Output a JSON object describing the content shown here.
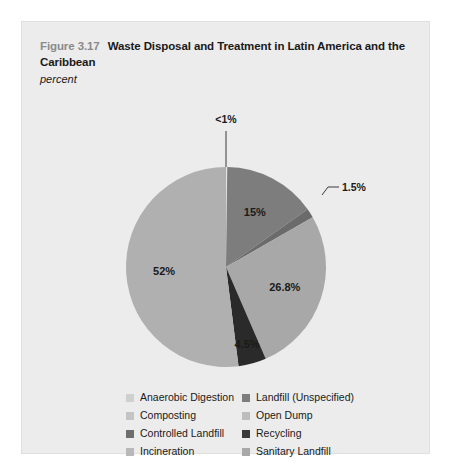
{
  "figure": {
    "number": "Figure 3.17",
    "title": "Waste Disposal and Treatment in Latin America and the Caribbean",
    "subtitle": "percent"
  },
  "chart_data": {
    "type": "pie",
    "title": "Waste Disposal and Treatment in Latin America and the Caribbean",
    "subtitle": "percent",
    "unit": "percent",
    "legend_position": "bottom",
    "start_angle_deg": 0,
    "direction": "clockwise",
    "categories": [
      "Anaerobic Digestion",
      "Landfill (Unspecified)",
      "Open Dump",
      "Sanitary Landfill",
      "Recycling",
      "Composting"
    ],
    "values": [
      0.2,
      15.0,
      1.5,
      26.8,
      4.5,
      52.0
    ],
    "labels": [
      "<1%",
      "15%",
      "1.5%",
      "26.8%",
      "4.5%",
      "52%"
    ],
    "colors": [
      "#e3e3e3",
      "#7d7d7d",
      "#6b6b6b",
      "#a8a8a8",
      "#2a2a2a",
      "#b0b0b0"
    ],
    "callouts": [
      "<1%",
      "1.5%"
    ],
    "inner_labels": [
      "15%",
      "26.8%",
      "4.5%",
      "52%"
    ]
  },
  "slices": [
    {
      "name": "anaerobic-digestion",
      "label": "<1%",
      "value": 0.2,
      "color": "#e3e3e3"
    },
    {
      "name": "landfill-unspecified",
      "label": "15%",
      "value": 15.0,
      "color": "#7d7d7d"
    },
    {
      "name": "open-dump",
      "label": "1.5%",
      "value": 1.5,
      "color": "#6b6b6b"
    },
    {
      "name": "sanitary-landfill",
      "label": "26.8%",
      "value": 26.8,
      "color": "#a8a8a8"
    },
    {
      "name": "recycling",
      "label": "4.5%",
      "value": 4.5,
      "color": "#2a2a2a"
    },
    {
      "name": "composting",
      "label": "52%",
      "value": 52.0,
      "color": "#b0b0b0"
    }
  ],
  "legend": {
    "left": [
      {
        "label": "Anaerobic Digestion",
        "color": "#cfcfcf"
      },
      {
        "label": "Composting",
        "color": "#c4c4c4"
      },
      {
        "label": "Controlled Landfill",
        "color": "#6e6e6e"
      },
      {
        "label": "Incineration",
        "color": "#b8b8b8"
      }
    ],
    "right": [
      {
        "label": "Landfill (Unspecified)",
        "color": "#7d7d7d"
      },
      {
        "label": "Open Dump",
        "color": "#bdbdbd"
      },
      {
        "label": "Recycling",
        "color": "#3a3a3a"
      },
      {
        "label": "Sanitary Landfill",
        "color": "#a8a8a8"
      }
    ]
  }
}
